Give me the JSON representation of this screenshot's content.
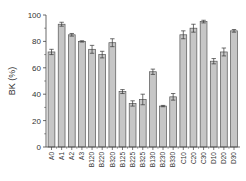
{
  "chart_data": {
    "type": "bar",
    "title": "",
    "xlabel": "",
    "ylabel": "BK (%)",
    "ylim": [
      0,
      100
    ],
    "yticks": [
      0,
      20,
      40,
      60,
      80,
      100
    ],
    "ytick_labels": [
      "0",
      "20",
      "40",
      "60",
      "80",
      "100"
    ],
    "grid": false,
    "legend": "none",
    "bar_color": "#c6c6c6",
    "bar_edge_color": "#555555",
    "categories": [
      "A0",
      "A1",
      "A2",
      "A3",
      "B120",
      "B220",
      "B320",
      "B125",
      "B225",
      "B325",
      "B130",
      "B230",
      "B330",
      "C10",
      "C20",
      "C30",
      "D10",
      "D20",
      "D30"
    ],
    "values": [
      72,
      93,
      85,
      80,
      74,
      70,
      79,
      42,
      33,
      36,
      57,
      31,
      38,
      85,
      90,
      95,
      65,
      72,
      88
    ],
    "errors": [
      2,
      1.5,
      1,
      0.5,
      3,
      2.5,
      3,
      1.5,
      2,
      4,
      2,
      0.5,
      2.5,
      3,
      3,
      1,
      2,
      3,
      1
    ]
  }
}
